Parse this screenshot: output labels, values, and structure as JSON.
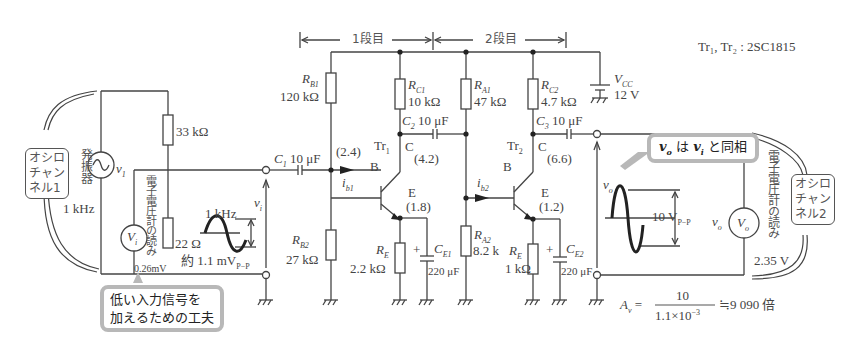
{
  "stage_labels": {
    "stage1": "1段目",
    "stage2": "2段目"
  },
  "transistor_note": "Tr₁, Tr₂ : 2SC1815",
  "supply": {
    "name": "V",
    "sub": "CC",
    "value": "12 V"
  },
  "components": {
    "r_b1": {
      "name": "R",
      "sub": "B1",
      "value": "120 kΩ"
    },
    "r_b2": {
      "name": "R",
      "sub": "B2",
      "value": "27 kΩ"
    },
    "r_c1": {
      "name": "R",
      "sub": "C1",
      "value": "10 kΩ"
    },
    "r_e1": {
      "name": "R",
      "sub": "E",
      "value": "2.2 kΩ"
    },
    "c_e1": {
      "name": "C",
      "sub": "E1",
      "value": "220 μF"
    },
    "r_a1": {
      "name": "R",
      "sub": "A1",
      "value": "47 kΩ"
    },
    "r_a2": {
      "name": "R",
      "sub": "A2",
      "value": "8.2 k"
    },
    "r_c2": {
      "name": "R",
      "sub": "C2",
      "value": "4.7 kΩ"
    },
    "r_e2": {
      "name": "R",
      "sub": "E",
      "value": "1 kΩ"
    },
    "c_e2": {
      "name": "C",
      "sub": "E2",
      "value": "220 μF"
    },
    "c1": {
      "name": "C",
      "sub": "1",
      "value": "10 μF"
    },
    "c2": {
      "name": "C",
      "sub": "2",
      "value": "10 μF"
    },
    "c3": {
      "name": "C",
      "sub": "3",
      "value": "10 μF"
    },
    "r_33k": {
      "value": "33 kΩ"
    },
    "r_22": {
      "value": "22 Ω"
    }
  },
  "transistors": {
    "tr1": {
      "name": "Tr",
      "sub": "1",
      "base": "B",
      "collector": "C",
      "emitter": "E",
      "v_base": "(2.4)",
      "v_collector": "(4.2)",
      "v_emitter": "(1.8)",
      "ib": "i",
      "ib_sub": "b1"
    },
    "tr2": {
      "name": "Tr",
      "sub": "2",
      "base": "B",
      "collector": "C",
      "emitter": "E",
      "v_collector": "(6.6)",
      "v_emitter": "(1.2)",
      "ib": "i",
      "ib_sub": "b2"
    }
  },
  "input": {
    "oscillator_label": "発振器",
    "oscillator_freq": "1 kHz",
    "source": "v",
    "source_sub": "1",
    "meter": "V",
    "meter_sub": "i",
    "meter_reading_label": "電子電圧計の読み",
    "meter_reading": "0.26mV",
    "vi_label": "v",
    "vi_sub": "i",
    "wave_freq": "1 kHz",
    "wave_amplitude": "約 1.1 mV",
    "wave_amplitude_sub": "P−P",
    "scope": "オシロ\nチャン\nネル1"
  },
  "output": {
    "vo_label": "v",
    "vo_sub": "o",
    "meter": "V",
    "meter_sub": "o",
    "meter_reading_label": "電子電圧計の読み",
    "meter_reading": "2.35 V",
    "wave_amplitude": "10 V",
    "wave_amplitude_sub": "P−P",
    "scope": "オシロ\nチャン\nネル2"
  },
  "callouts": {
    "input_tip": "低い入力信号を\n加えるための工夫",
    "phase_a": "v",
    "phase_a_sub": "o",
    "phase_mid": " は ",
    "phase_b": "v",
    "phase_b_sub": "i",
    "phase_end": " と同相"
  },
  "gain_formula": {
    "lhs": "A",
    "lhs_sub": "v",
    "numerator": "10",
    "denominator": "1.1×10",
    "denominator_exp": "−3",
    "result": "≒9 090 倍"
  }
}
